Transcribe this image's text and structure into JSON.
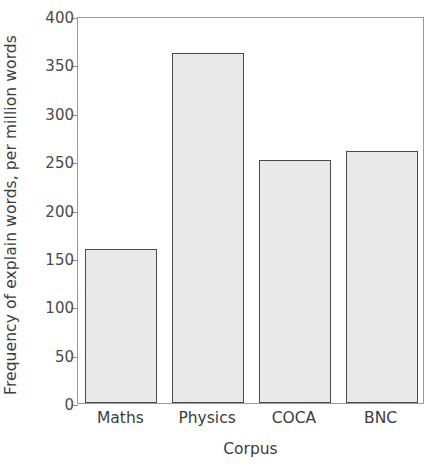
{
  "chart_data": {
    "type": "bar",
    "title": "",
    "subtitle": "",
    "xlabel": "Corpus",
    "ylabel": "Frequency of explain words, per million words",
    "categories": [
      "Maths",
      "Physics",
      "COCA",
      "BNC"
    ],
    "values": [
      159,
      362,
      251,
      260
    ],
    "ylim": [
      0,
      400
    ],
    "yticks": [
      0,
      50,
      100,
      150,
      200,
      250,
      300,
      350,
      400
    ],
    "ytick_labels": [
      "0",
      "50",
      "100",
      "150",
      "200",
      "250",
      "300",
      "350",
      "400"
    ],
    "grid": false,
    "legend": null,
    "legend_position": "none",
    "annotations": [],
    "colors": {
      "bar_fill": "#e9e9e9",
      "bar_edge": "#4b4b4b",
      "axis": "#9a9a9a",
      "tick": "#8e8e8e",
      "text": "#3c3c3c",
      "background": "#ffffff"
    }
  }
}
